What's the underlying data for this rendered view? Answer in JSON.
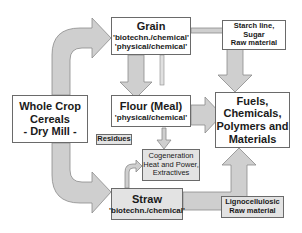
{
  "diagram": {
    "source_node": {
      "line1": "Whole Crop",
      "line2": "Cereals",
      "line3": "- Dry Mill -"
    },
    "grain": {
      "title": "Grain",
      "line1": "'biotechn./chemical'",
      "line2": "'physical/chemical'"
    },
    "flour": {
      "title": "Flour (Meal)",
      "line1": "'physical/chemical'"
    },
    "straw": {
      "title": "Straw",
      "line1": "'biotechn./chemical'"
    },
    "residues": {
      "label": "Residues"
    },
    "cogeneration": {
      "line1": "Cogeneration",
      "line2": "Heat and Power,",
      "line3": "Extractives"
    },
    "starch_note": {
      "line1": "Starch line,",
      "line2": "Sugar",
      "line3": "Raw material"
    },
    "ligno_note": {
      "line1": "Lignocellulosic",
      "line2": "Raw material"
    },
    "products": {
      "line1": "Fuels,",
      "line2": "Chemicals,",
      "line3": "Polymers and",
      "line4": "Materials"
    },
    "colors": {
      "arrow_fill": "#cfcfcf",
      "arrow_stroke": "#8a8a8a",
      "box_border": "#6a6a6a",
      "grey_box": "#e3e3e3"
    },
    "flows": [
      {
        "from": "Whole Crop Cereals",
        "to": "Grain"
      },
      {
        "from": "Whole Crop Cereals",
        "to": "Straw"
      },
      {
        "from": "Grain",
        "to": "Flour (Meal)"
      },
      {
        "from": "Grain",
        "to": "Cogeneration"
      },
      {
        "from": "Grain",
        "to": "Fuels, Chemicals, Polymers and Materials"
      },
      {
        "from": "Flour (Meal)",
        "to": "Fuels, Chemicals, Polymers and Materials"
      },
      {
        "from": "Straw",
        "to": "Cogeneration"
      },
      {
        "from": "Straw",
        "to": "Fuels, Chemicals, Polymers and Materials"
      }
    ]
  }
}
